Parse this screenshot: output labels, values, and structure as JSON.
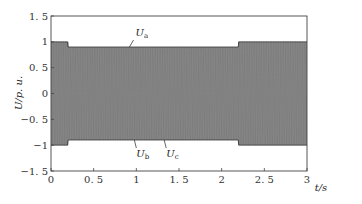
{
  "chart_data": {
    "type": "line",
    "title": "",
    "xlabel": "t/s",
    "ylabel": "U/p.u.",
    "xlim": [
      0,
      3
    ],
    "ylim": [
      -1.5,
      1.5
    ],
    "x_ticks": [
      "0",
      "0.5",
      "1",
      "1.5",
      "2",
      "2.5",
      "3"
    ],
    "y_ticks": [
      "1.5",
      "1",
      "0.5",
      "0",
      "-0.5",
      "-1",
      "-1.5"
    ],
    "grid": false,
    "legend": "none",
    "annotations": [
      {
        "text": "Ua",
        "base": "U",
        "sub": "a",
        "t": 0.92,
        "y": 0.9,
        "position": "above"
      },
      {
        "text": "Ub",
        "base": "U",
        "sub": "b",
        "t": 1.0,
        "y": -0.9,
        "position": "below"
      },
      {
        "text": "Uc",
        "base": "U",
        "sub": "c",
        "t": 1.35,
        "y": -0.9,
        "position": "below"
      }
    ],
    "series": [
      {
        "name": "Ua",
        "description": "three-phase sinusoidal voltage, dense oscillation"
      },
      {
        "name": "Ub",
        "description": "three-phase sinusoidal voltage, dense oscillation"
      },
      {
        "name": "Uc",
        "description": "three-phase sinusoidal voltage, dense oscillation"
      }
    ],
    "envelope": {
      "t": [
        0,
        0.2,
        0.2,
        2.2,
        2.2,
        3.0
      ],
      "amplitude": [
        1.0,
        1.0,
        0.9,
        0.9,
        1.0,
        1.0
      ]
    },
    "frequency_hz": 50
  },
  "labels": {
    "ylabel_text": "U/p. u.",
    "xlabel_text": "t/s"
  }
}
